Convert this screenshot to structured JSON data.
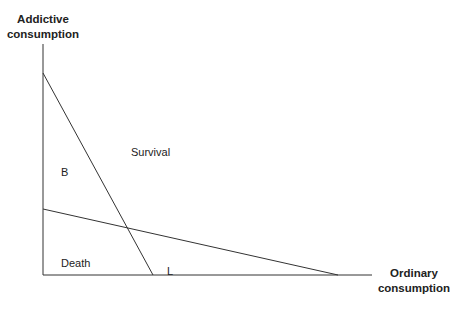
{
  "axes": {
    "y_title_line1": "Addictive",
    "y_title_line2": "consumption",
    "x_title_line1": "Ordinary",
    "x_title_line2": "consumption"
  },
  "regions": {
    "survival": "Survival",
    "b": "B",
    "death": "Death",
    "l": "L"
  }
}
